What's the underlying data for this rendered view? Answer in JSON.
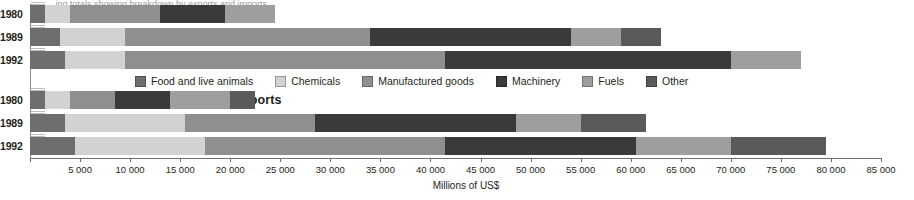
{
  "figure": {
    "top_caption": "...ing totals showing breakdown by exports and imports",
    "sections": [
      {
        "key": "exports",
        "title": "Exports"
      },
      {
        "key": "imports",
        "title": "Imports"
      }
    ]
  },
  "legend": {
    "position": "inside-middle",
    "items": [
      {
        "label": "Food and live animals",
        "color": "#6e6e6e"
      },
      {
        "label": "Chemicals",
        "color": "#d2d2d2"
      },
      {
        "label": "Manufactured goods",
        "color": "#8f8f8f"
      },
      {
        "label": "Machinery",
        "color": "#3a3a3a"
      },
      {
        "label": "Fuels",
        "color": "#9e9e9e"
      },
      {
        "label": "Other",
        "color": "#5a5a5a"
      }
    ]
  },
  "axis": {
    "title": "Millions of US$",
    "min": 0,
    "max": 85000,
    "step": 5000,
    "ticks": [
      0,
      5000,
      10000,
      15000,
      20000,
      25000,
      30000,
      35000,
      40000,
      45000,
      50000,
      55000,
      60000,
      65000,
      70000,
      75000,
      80000,
      85000
    ],
    "tick_labels": [
      "",
      "5 000",
      "10 000",
      "15 000",
      "20 000",
      "25 000",
      "30 000",
      "35 000",
      "40 000",
      "45 000",
      "50 000",
      "55 000",
      "60 000",
      "65 000",
      "70 000",
      "75 000",
      "80 000",
      "85 000"
    ]
  },
  "chart_data": {
    "type": "bar",
    "orientation": "horizontal",
    "stacked": true,
    "title": "Exports and Imports",
    "xlabel": "Millions of US$",
    "ylabel": "",
    "xlim": [
      0,
      85000
    ],
    "grid": false,
    "legend_position": "inside-middle",
    "categories": [
      "1980",
      "1989",
      "1992"
    ],
    "series": [
      {
        "name": "Food and live animals",
        "color": "#6e6e6e"
      },
      {
        "name": "Chemicals",
        "color": "#d2d2d2"
      },
      {
        "name": "Manufactured goods",
        "color": "#8f8f8f"
      },
      {
        "name": "Machinery",
        "color": "#3a3a3a"
      },
      {
        "name": "Fuels",
        "color": "#9e9e9e"
      },
      {
        "name": "Other",
        "color": "#5a5a5a"
      }
    ],
    "panels": [
      {
        "name": "Exports",
        "rows": [
          {
            "category": "1980",
            "total": 24500,
            "values": [
              1500,
              2500,
              9000,
              6500,
              5000,
              0
            ]
          },
          {
            "category": "1989",
            "total": 63000,
            "values": [
              3000,
              6500,
              24500,
              20000,
              5000,
              4000
            ]
          },
          {
            "category": "1992",
            "total": 77000,
            "values": [
              3500,
              6000,
              32000,
              28500,
              7000,
              0
            ]
          }
        ]
      },
      {
        "name": "Imports",
        "rows": [
          {
            "category": "1980",
            "total": 22500,
            "values": [
              1500,
              2500,
              4500,
              5500,
              6000,
              2500
            ]
          },
          {
            "category": "1989",
            "total": 61500,
            "values": [
              3500,
              12000,
              13000,
              20000,
              6500,
              6500
            ]
          },
          {
            "category": "1992",
            "total": 79500,
            "values": [
              4500,
              13000,
              24000,
              19000,
              9500,
              9500
            ]
          }
        ]
      }
    ]
  }
}
